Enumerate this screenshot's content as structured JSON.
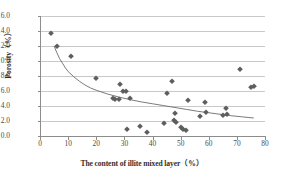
{
  "chart_data": {
    "type": "scatter",
    "title": "",
    "xlabel": "The content of illite mixed layer（%）",
    "ylabel": "Porosity（%）",
    "xlim": [
      0,
      80
    ],
    "ylim": [
      0,
      16
    ],
    "xticks": [
      "0",
      "10",
      "20",
      "30",
      "40",
      "50",
      "60",
      "70",
      "80"
    ],
    "yticks": [
      "0.0",
      "2.0",
      "4.0",
      "6.0",
      "8.0",
      "10.0",
      "12.0",
      "14.0",
      "16.0"
    ],
    "xtick_values": [
      0,
      10,
      20,
      30,
      40,
      50,
      60,
      70,
      80
    ],
    "ytick_values": [
      0,
      2,
      4,
      6,
      8,
      10,
      12,
      14,
      16
    ],
    "grid": "horizontal",
    "legend": "none",
    "marker": "diamond",
    "marker_color": "#5e5e5e",
    "trend_color": "#6b6b6b",
    "trendline": {
      "type": "power",
      "points": [
        [
          5.0,
          12.0
        ],
        [
          6.0,
          11.1
        ],
        [
          7.0,
          10.3
        ],
        [
          8.0,
          9.7
        ],
        [
          9.0,
          9.1
        ],
        [
          10.0,
          8.6
        ],
        [
          12.0,
          7.9
        ],
        [
          14.0,
          7.3
        ],
        [
          16.0,
          6.8
        ],
        [
          18.0,
          6.4
        ],
        [
          20.0,
          6.1
        ],
        [
          24.0,
          5.6
        ],
        [
          28.0,
          5.2
        ],
        [
          32.0,
          4.85
        ],
        [
          36.0,
          4.55
        ],
        [
          40.0,
          4.3
        ],
        [
          44.0,
          4.05
        ],
        [
          48.0,
          3.8
        ],
        [
          52.0,
          3.55
        ],
        [
          56.0,
          3.3
        ],
        [
          60.0,
          3.1
        ],
        [
          64.0,
          2.9
        ],
        [
          68.0,
          2.7
        ],
        [
          72.0,
          2.55
        ],
        [
          76.0,
          2.4
        ]
      ]
    },
    "points": [
      [
        4.0,
        13.8
      ],
      [
        6.0,
        12.0
      ],
      [
        11.0,
        10.7
      ],
      [
        20.0,
        7.7
      ],
      [
        26.0,
        5.1
      ],
      [
        26.8,
        5.0
      ],
      [
        28.0,
        4.95
      ],
      [
        28.5,
        7.0
      ],
      [
        29.5,
        6.0
      ],
      [
        30.5,
        6.0
      ],
      [
        31.0,
        0.95
      ],
      [
        32.0,
        5.1
      ],
      [
        35.5,
        1.4
      ],
      [
        38.0,
        0.6
      ],
      [
        44.0,
        1.7
      ],
      [
        45.0,
        5.7
      ],
      [
        47.0,
        7.4
      ],
      [
        47.5,
        2.2
      ],
      [
        48.0,
        3.1
      ],
      [
        48.2,
        1.9
      ],
      [
        50.0,
        1.2
      ],
      [
        51.0,
        1.0
      ],
      [
        52.0,
        0.85
      ],
      [
        52.5,
        4.8
      ],
      [
        57.0,
        2.65
      ],
      [
        58.5,
        4.5
      ],
      [
        59.0,
        3.2
      ],
      [
        65.0,
        2.85
      ],
      [
        66.0,
        3.7
      ],
      [
        66.5,
        3.0
      ],
      [
        71.0,
        8.9
      ],
      [
        75.0,
        6.5
      ],
      [
        76.0,
        6.7
      ]
    ]
  }
}
